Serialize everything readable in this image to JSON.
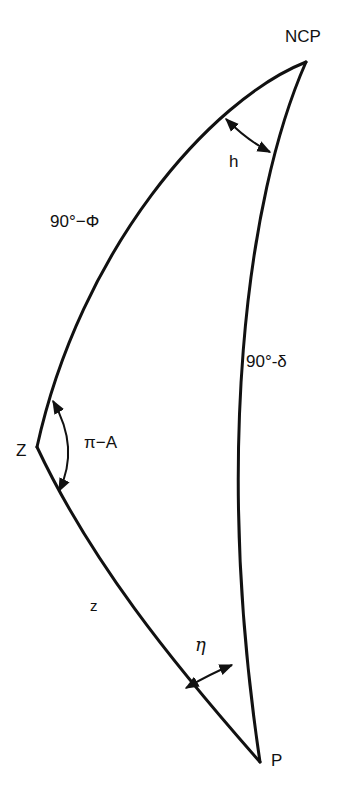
{
  "diagram": {
    "colors": {
      "background": "#ffffff",
      "stroke": "#111111"
    },
    "vertices": {
      "ncp": {
        "label": "NCP",
        "x": 306,
        "y": 62
      },
      "zenith": {
        "label": "Z",
        "x": 37,
        "y": 447
      },
      "object": {
        "label": "P",
        "x": 260,
        "y": 762
      }
    },
    "sides": {
      "ncp_to_zenith": {
        "label": "90°−Φ"
      },
      "ncp_to_object": {
        "label": "90°-δ"
      },
      "zenith_to_object": {
        "label": "z"
      }
    },
    "angles": {
      "at_ncp": {
        "label": "h",
        "arrow": "double-headed"
      },
      "at_zenith": {
        "label": "π−A",
        "arrow": "double-headed"
      },
      "at_object": {
        "label": "η",
        "arrow": "double-headed"
      }
    }
  }
}
